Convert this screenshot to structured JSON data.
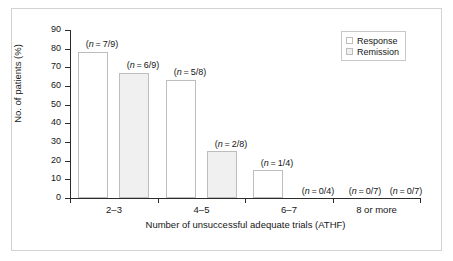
{
  "chart_data": {
    "type": "bar",
    "title": "",
    "xlabel": "Number of unsuccessful adequate trials (ATHF)",
    "ylabel": "No. of patients (%)",
    "ylim": [
      0,
      90
    ],
    "yticks": [
      0,
      10,
      20,
      30,
      40,
      50,
      60,
      70,
      80,
      90
    ],
    "grid": false,
    "legend_position": "top-right",
    "categories": [
      "2–3",
      "4–5",
      "6–7",
      "8 or more"
    ],
    "series": [
      {
        "name": "Response",
        "values": [
          78,
          63,
          25,
          0
        ],
        "annotations": [
          "(n = 7/9)",
          "(n = 5/8)",
          "(n = 1/4)",
          "(n = 0/7)"
        ]
      },
      {
        "name": "Remission",
        "values": [
          67,
          25,
          0,
          0
        ],
        "annotations": [
          "(n = 6/9)",
          "(n = 2/8)",
          "(n = 0/4)",
          "(n = 0/7)"
        ]
      }
    ],
    "bars": [
      {
        "label": "(n = 7/9)",
        "n_prefix": "(",
        "n_italic": "n",
        "n_suffix": " = 7/9)",
        "value": 78,
        "series": "Response",
        "group": "2–3"
      },
      {
        "label": "(n = 6/9)",
        "n_prefix": "(",
        "n_italic": "n",
        "n_suffix": " = 6/9)",
        "value": 67,
        "series": "Remission",
        "group": "2–3"
      },
      {
        "label": "(n = 5/8)",
        "n_prefix": "(",
        "n_italic": "n",
        "n_suffix": " = 5/8)",
        "value": 63,
        "series": "Response",
        "group": "4–5"
      },
      {
        "label": "(n = 2/8)",
        "n_prefix": "(",
        "n_italic": "n",
        "n_suffix": " = 2/8)",
        "value": 25,
        "series": "Remission",
        "group": "4–5"
      },
      {
        "label": "(n = 1/4)",
        "n_prefix": "(",
        "n_italic": "n",
        "n_suffix": " = 1/4)",
        "value": 15,
        "series": "Response",
        "group": "6–7"
      },
      {
        "label": "(n = 0/4)",
        "n_prefix": "(",
        "n_italic": "n",
        "n_suffix": " = 0/4)",
        "value": 0,
        "series": "Remission",
        "group": "6–7"
      },
      {
        "label": "(n = 0/7)",
        "n_prefix": "(",
        "n_italic": "n",
        "n_suffix": " = 0/7)",
        "value": 0,
        "series": "Response",
        "group": "8 or more"
      },
      {
        "label": "(n = 0/7)",
        "n_prefix": "(",
        "n_italic": "n",
        "n_suffix": " = 0/7)",
        "value": 0,
        "series": "Remission",
        "group": "8 or more"
      }
    ],
    "colors": {
      "response_fill": "#ffffff",
      "remission_fill": "#f0f0f0",
      "bar_stroke": "#bdbdbd",
      "axis": "#2b2b2b",
      "text": "#161616",
      "frame": "#d2d2d2"
    }
  },
  "axis": {
    "y_title": "No. of patients (%)",
    "x_title": "Number of unsuccessful adequate trials (ATHF)",
    "y_ticks": [
      "90",
      "80",
      "70",
      "60",
      "50",
      "40",
      "30",
      "20",
      "10",
      "0"
    ],
    "x_groups": [
      "2–3",
      "4–5",
      "6–7",
      "8 or more"
    ]
  },
  "legend": {
    "items": [
      {
        "label": "Response",
        "swatch": "response"
      },
      {
        "label": "Remission",
        "swatch": "remission"
      }
    ]
  },
  "bar_labels": {
    "b0": "(n = 7/9)",
    "b1": "(n = 6/9)",
    "b2": "(n = 5/8)",
    "b3": "(n = 2/8)",
    "b4": "(n = 1/4)",
    "b5": "(n = 0/4)",
    "b6": "(n = 0/7)",
    "b7": "(n = 0/7)"
  }
}
